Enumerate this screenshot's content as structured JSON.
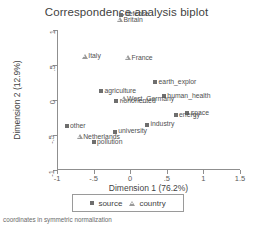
{
  "chart_data": {
    "type": "scatter",
    "title": "Correspondence analysis biplot",
    "xlabel": "Dimension 1 (76.2%)",
    "ylabel": "Dimension 2 (12.9%)",
    "xlim": [
      -1,
      1.5
    ],
    "ylim": [
      -1,
      1
    ],
    "xticks": [
      "-1",
      "-.5",
      "0",
      ".5",
      "1",
      "1.5"
    ],
    "xtickvals": [
      -1,
      -0.5,
      0,
      0.5,
      1,
      1.5
    ],
    "yticks": [
      "1",
      ".5",
      "0",
      "-.5",
      "-1"
    ],
    "ytickvals": [
      1,
      0.5,
      0,
      -0.5,
      -1
    ],
    "grid": false,
    "legend_position": "bottom-center",
    "footnote": "coordinates in symmetric normalization",
    "legend": [
      {
        "label": "source",
        "marker": "filled-square",
        "color": "#6e6e6e"
      },
      {
        "label": "country",
        "marker": "open-triangle",
        "color": "#9a9a9a"
      }
    ],
    "series": [
      {
        "name": "source",
        "marker": "filled-square",
        "points": [
          {
            "label": "space",
            "x": 0.78,
            "y": -0.19,
            "side": "right"
          },
          {
            "label": "energy",
            "x": 0.62,
            "y": -0.21,
            "side": "right"
          },
          {
            "label": "human_health",
            "x": 0.46,
            "y": 0.06,
            "side": "right"
          },
          {
            "label": "earth_explor",
            "x": 0.34,
            "y": 0.26,
            "side": "right"
          },
          {
            "label": "industry",
            "x": 0.23,
            "y": -0.35,
            "side": "right"
          },
          {
            "label": "defense",
            "x": -0.12,
            "y": 1.22,
            "side": "right"
          },
          {
            "label": "nonoriented",
            "x": -0.19,
            "y": -0.02,
            "side": "right"
          },
          {
            "label": "university",
            "x": -0.21,
            "y": -0.45,
            "side": "right"
          },
          {
            "label": "agriculture",
            "x": -0.4,
            "y": 0.13,
            "side": "right"
          },
          {
            "label": "pollution",
            "x": -0.5,
            "y": -0.6,
            "side": "right"
          },
          {
            "label": "other",
            "x": -0.87,
            "y": -0.37,
            "side": "right"
          }
        ]
      },
      {
        "name": "country",
        "marker": "open-triangle",
        "points": [
          {
            "label": "Italy",
            "x": -0.62,
            "y": 0.62,
            "side": "right"
          },
          {
            "label": "West_Germany",
            "x": -0.09,
            "y": 0.01,
            "side": "right"
          },
          {
            "label": "France",
            "x": -0.03,
            "y": 0.6,
            "side": "right"
          },
          {
            "label": "Britain",
            "x": -0.14,
            "y": 1.14,
            "side": "right"
          },
          {
            "label": "Netherlands",
            "x": -0.69,
            "y": -0.53,
            "side": "right"
          }
        ]
      }
    ]
  }
}
